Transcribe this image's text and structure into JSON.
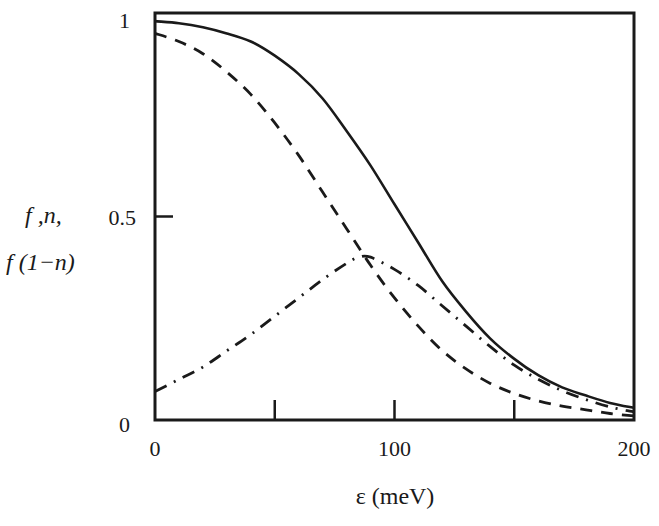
{
  "chart_data": {
    "type": "line",
    "title": "",
    "xlabel": "ε (meV)",
    "ylabel_lines": [
      "f ,n,",
      "f (1−n)"
    ],
    "xlim": [
      0,
      200
    ],
    "ylim": [
      0,
      1
    ],
    "grid": false,
    "legend": null,
    "x_ticks": [
      0,
      50,
      100,
      150,
      200
    ],
    "x_tick_labels": [
      "0",
      "",
      "100",
      "",
      "200"
    ],
    "y_ticks": [
      0,
      0.5,
      1
    ],
    "y_tick_labels": [
      "0",
      "0.5",
      "1"
    ],
    "series": [
      {
        "name": "f",
        "style": "solid",
        "x": [
          0,
          10,
          20,
          30,
          40,
          50,
          60,
          70,
          80,
          90,
          100,
          110,
          120,
          130,
          140,
          150,
          160,
          170,
          180,
          190,
          200
        ],
        "values": [
          0.98,
          0.975,
          0.965,
          0.95,
          0.93,
          0.895,
          0.85,
          0.79,
          0.71,
          0.625,
          0.53,
          0.435,
          0.34,
          0.265,
          0.2,
          0.15,
          0.11,
          0.08,
          0.06,
          0.042,
          0.03
        ]
      },
      {
        "name": "n",
        "style": "dashed",
        "x": [
          0,
          10,
          20,
          30,
          40,
          50,
          60,
          70,
          80,
          90,
          100,
          110,
          120,
          130,
          140,
          150,
          160,
          170,
          180,
          190,
          200
        ],
        "values": [
          0.95,
          0.93,
          0.9,
          0.855,
          0.8,
          0.73,
          0.65,
          0.56,
          0.47,
          0.38,
          0.3,
          0.23,
          0.17,
          0.125,
          0.09,
          0.065,
          0.047,
          0.034,
          0.025,
          0.016,
          0.01
        ]
      },
      {
        "name": "f(1-n)",
        "style": "dashdot",
        "x": [
          0,
          10,
          20,
          30,
          40,
          50,
          60,
          70,
          80,
          85,
          90,
          100,
          110,
          120,
          130,
          140,
          150,
          160,
          170,
          180,
          190,
          200
        ],
        "values": [
          0.07,
          0.1,
          0.13,
          0.17,
          0.21,
          0.255,
          0.3,
          0.345,
          0.385,
          0.4,
          0.4,
          0.37,
          0.33,
          0.28,
          0.23,
          0.18,
          0.135,
          0.1,
          0.072,
          0.05,
          0.032,
          0.02
        ]
      }
    ]
  }
}
